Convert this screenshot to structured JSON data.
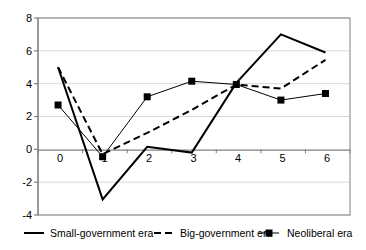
{
  "chart_data": {
    "type": "line",
    "title": "",
    "subtitle": "",
    "xlabel": "",
    "ylabel": "",
    "x": [
      0,
      1,
      2,
      3,
      4,
      5,
      6
    ],
    "xtick_labels": [
      "0",
      "1",
      "2",
      "3",
      "4",
      "5",
      "6"
    ],
    "ytick_labels": [
      "8",
      "6",
      "4",
      "2",
      "0",
      "-2",
      "-4"
    ],
    "yticks": [
      8,
      6,
      4,
      2,
      0,
      -2,
      -4
    ],
    "xlim": [
      -0.45,
      6.55
    ],
    "ylim": [
      -4,
      8
    ],
    "grid": true,
    "grid_axis": "y",
    "legend_position": "bottom",
    "series": [
      {
        "name": "Small-government era",
        "style": "solid",
        "marker": "none",
        "color": "#000000",
        "values": [
          5.0,
          -3.05,
          0.15,
          -0.2,
          4.05,
          7.0,
          5.9
        ]
      },
      {
        "name": "Big-government era",
        "style": "dashed",
        "marker": "none",
        "color": "#000000",
        "values": [
          5.0,
          -0.3,
          1.0,
          2.4,
          3.95,
          3.7,
          5.45
        ]
      },
      {
        "name": "Neoliberal era",
        "style": "solid-thin",
        "marker": "square",
        "color": "#000000",
        "values": [
          2.7,
          -0.45,
          3.2,
          4.15,
          3.95,
          3.0,
          3.4
        ]
      }
    ]
  },
  "legend": {
    "items": [
      {
        "label": "Small-government era",
        "swatch": "solid-line-swatch"
      },
      {
        "label": "Big-government era",
        "swatch": "dashed-line-swatch"
      },
      {
        "label": "Neoliberal era",
        "swatch": "square-marker-line-swatch"
      }
    ]
  },
  "colors": {
    "series": "#000000",
    "grid": "#d9d9d9",
    "axis": "#808080",
    "zero_axis": "#808080",
    "plot_border": "#808080",
    "background": "#ffffff"
  }
}
